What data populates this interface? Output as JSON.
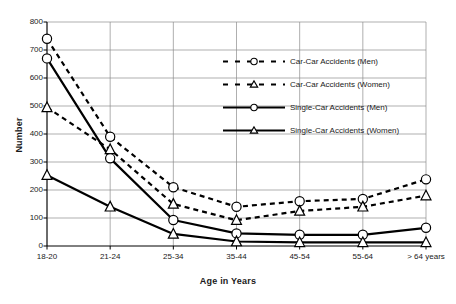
{
  "chart_data": {
    "type": "line",
    "title": "",
    "xlabel": "Age in Years",
    "ylabel": "Number",
    "categories": [
      "18-20",
      "21-24",
      "25-34",
      "35-44",
      "45-54",
      "55-64",
      "> 64 years"
    ],
    "ylim": [
      0,
      800
    ],
    "yticks": [
      "0",
      "100",
      "200",
      "300",
      "400",
      "500",
      "600",
      "700",
      "800"
    ],
    "ytick_step": 100,
    "grid": "horizontal-and-vertical",
    "legend_position": "inside-upper-center-right",
    "series": [
      {
        "name": "Car-Car Accidents (Men)",
        "marker": "circle-open",
        "linestyle": "dashed",
        "color": "#000000",
        "values": [
          740,
          390,
          210,
          140,
          160,
          168,
          238
        ]
      },
      {
        "name": "Car-Car Accidents (Women)",
        "marker": "triangle-open",
        "linestyle": "dashed",
        "color": "#000000",
        "values": [
          495,
          345,
          150,
          92,
          125,
          140,
          180
        ]
      },
      {
        "name": "Single-Car Accidents (Men)",
        "marker": "circle-open",
        "linestyle": "solid",
        "color": "#000000",
        "values": [
          670,
          313,
          93,
          45,
          40,
          40,
          65
        ]
      },
      {
        "name": "Single-Car Accidents (Women)",
        "marker": "triangle-open",
        "linestyle": "solid",
        "color": "#000000",
        "values": [
          253,
          140,
          43,
          16,
          13,
          13,
          13
        ]
      }
    ]
  },
  "legend": {
    "items": [
      {
        "label": "Car-Car Accidents (Men)"
      },
      {
        "label": "Car-Car Accidents (Women)"
      },
      {
        "label": "Single-Car Accidents (Men)"
      },
      {
        "label": "Single-Car Accidents (Women)"
      }
    ]
  },
  "axes": {
    "y_title": "Number",
    "x_title": "Age in Years"
  }
}
